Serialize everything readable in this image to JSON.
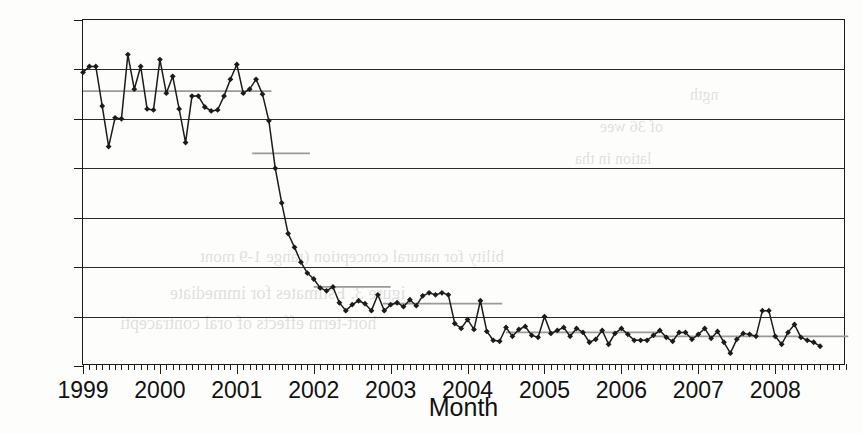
{
  "chart_data": {
    "type": "line",
    "title": "",
    "xlabel": "Month",
    "ylabel": "Less than 39 weeks (%)",
    "xlim": [
      1999.0,
      2008.92
    ],
    "ylim": [
      0,
      35
    ],
    "ytick_labels": [
      "0",
      "5",
      "10",
      "15",
      "20",
      "25",
      "30",
      "35"
    ],
    "ytick_values": [
      0,
      5,
      10,
      15,
      20,
      25,
      30,
      35
    ],
    "xtick_labels": [
      "1999",
      "2000",
      "2001",
      "2002",
      "2003",
      "2004",
      "2005",
      "2006",
      "2007",
      "2008"
    ],
    "xtick_values": [
      1999,
      2000,
      2001,
      2002,
      2003,
      2004,
      2005,
      2006,
      2007,
      2008
    ],
    "x_minor_tick_interval_months": 1,
    "grid": "horizontal",
    "legend": "none",
    "marker": "filled-diamond",
    "line_color": "#1b1b1b",
    "mean_line_color": "#9a9a9a",
    "series": [
      {
        "name": "Less than 39 weeks",
        "x_start_year": 1999,
        "x_step_months": 1,
        "values": [
          29.7,
          30.3,
          30.3,
          26.3,
          22.2,
          25.1,
          25.0,
          31.5,
          28.0,
          30.3,
          26.0,
          25.9,
          31.0,
          27.6,
          29.3,
          26.0,
          22.6,
          27.3,
          27.3,
          26.2,
          25.8,
          25.9,
          27.3,
          29.0,
          30.5,
          27.6,
          28.0,
          29.0,
          27.5,
          24.8,
          20.0,
          16.5,
          13.4,
          12.0,
          10.5,
          9.4,
          8.8,
          7.9,
          7.6,
          8.0,
          6.4,
          5.6,
          6.2,
          6.6,
          6.3,
          5.6,
          7.2,
          5.6,
          6.2,
          6.4,
          6.0,
          6.7,
          6.1,
          7.1,
          7.4,
          7.2,
          7.4,
          7.2,
          4.3,
          3.8,
          4.7,
          3.7,
          6.6,
          3.5,
          2.6,
          2.5,
          3.9,
          3.0,
          3.7,
          4.0,
          3.1,
          2.9,
          5.0,
          3.3,
          3.6,
          3.9,
          3.0,
          3.8,
          3.4,
          2.4,
          2.7,
          3.6,
          2.2,
          3.3,
          3.8,
          3.2,
          2.6,
          2.6,
          2.6,
          3.1,
          3.6,
          2.9,
          2.5,
          3.4,
          3.4,
          2.7,
          3.2,
          3.8,
          2.8,
          3.5,
          2.4,
          1.3,
          2.7,
          3.3,
          3.2,
          3.0,
          5.6,
          5.6,
          3.0,
          2.2,
          3.4,
          4.2,
          2.9,
          2.6,
          2.4,
          2.0
        ]
      }
    ],
    "mean_segments": [
      {
        "label": "mean 1999-2001",
        "value": 27.8,
        "x_from": 1999.0,
        "x_to": 2001.45
      },
      {
        "label": "mean 2001",
        "value": 21.5,
        "x_from": 2001.2,
        "x_to": 2001.95
      },
      {
        "label": "mean 2002-2003",
        "value": 8.0,
        "x_from": 2002.0,
        "x_to": 2003.0
      },
      {
        "label": "mean 2003-2004",
        "value": 6.3,
        "x_from": 2002.9,
        "x_to": 2004.45
      },
      {
        "label": "mean 2004-2006",
        "value": 3.4,
        "x_from": 2004.5,
        "x_to": 2006.5
      },
      {
        "label": "mean 2006-2008",
        "value": 3.0,
        "x_from": 2006.4,
        "x_to": 2008.95
      }
    ],
    "annotations": [],
    "observations": {
      "description": "Monthly percentage of births at less than 39 weeks, January 1999 through late 2008. Values hold near 28% through mid-2001, drop sharply to about 8% by early 2002, then decline further to about 3% where they remain through 2008."
    }
  },
  "bleed_through": [
    {
      "text": "ngth",
      "x": 690,
      "y": 86,
      "size": 16
    },
    {
      "text": "of 36 wee",
      "x": 600,
      "y": 118,
      "size": 16
    },
    {
      "text": "lation in tha",
      "x": 575,
      "y": 150,
      "size": 16
    },
    {
      "text": "bility for natural conception (range 1-9 mont",
      "x": 200,
      "y": 247,
      "size": 17
    },
    {
      "text": "igure 3. Estimates for immediate",
      "x": 170,
      "y": 283,
      "size": 18
    },
    {
      "text": "hort-term effects of oral contracepti",
      "x": 120,
      "y": 313,
      "size": 18
    }
  ]
}
